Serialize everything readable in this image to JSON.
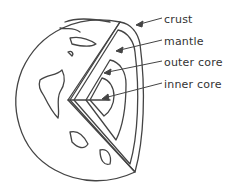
{
  "diagram": {
    "labels": [
      {
        "id": "crust",
        "text": "crust",
        "x": 164,
        "y": 14
      },
      {
        "id": "mantle",
        "text": "mantle",
        "x": 164,
        "y": 35
      },
      {
        "id": "outer_core",
        "text": "outer core",
        "x": 164,
        "y": 56
      },
      {
        "id": "inner_core",
        "text": "inner core",
        "x": 164,
        "y": 78
      }
    ],
    "colors": {
      "line": "#444444",
      "background": "#ffffff"
    }
  }
}
